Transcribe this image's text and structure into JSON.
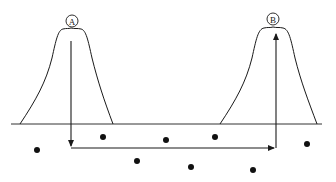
{
  "diagram": {
    "type": "tunneling-path",
    "colors": {
      "stroke": "#1a1a1a",
      "background": "#ffffff",
      "dot": "#111111"
    },
    "peaks": [
      {
        "id": "A",
        "label": "A",
        "circle_center": [
          72,
          21
        ]
      },
      {
        "id": "B",
        "label": "B",
        "circle_center": [
          273,
          19
        ]
      }
    ],
    "baseline": {
      "y": 124,
      "x_start": 11,
      "x_end": 322
    },
    "path": {
      "down": {
        "x": 71,
        "y_start": 41,
        "y_end": 147
      },
      "across": {
        "y": 148,
        "x_start": 71,
        "x_end": 276
      },
      "up": {
        "x": 276,
        "y_start": 148,
        "y_end": 32
      }
    },
    "dots": [
      [
        37,
        150
      ],
      [
        103,
        137
      ],
      [
        166,
        140
      ],
      [
        215,
        137
      ],
      [
        137,
        161
      ],
      [
        191,
        167
      ],
      [
        253,
        170
      ],
      [
        307,
        144
      ]
    ]
  }
}
